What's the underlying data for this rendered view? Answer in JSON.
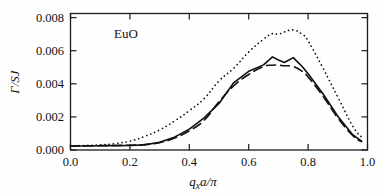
{
  "figure": {
    "annotation": "EuO",
    "background": "#fefefe"
  },
  "axes": {
    "x": {
      "title_q": "q",
      "title_sub": "x",
      "title_rest": "a/π",
      "ticks": [
        "0.0",
        "0.2",
        "0.4",
        "0.6",
        "0.8",
        "1.0"
      ],
      "min": 0.0,
      "max": 1.0
    },
    "y": {
      "title_gamma": "Γ/SJ",
      "ticks": [
        "0.000",
        "0.002",
        "0.004",
        "0.006",
        "0.008"
      ],
      "min": 0.0,
      "max": 0.0085
    }
  },
  "colors": {
    "curve": "#101010",
    "frame": "#1a1a1a",
    "text": "#111111"
  },
  "chart_data": {
    "type": "line",
    "title": "",
    "subtitle": "",
    "annotation": "EuO",
    "xlabel": "q_x a/π",
    "ylabel": "Γ/SJ",
    "xlim": [
      0.0,
      1.0
    ],
    "ylim": [
      0.0,
      0.0085
    ],
    "grid": false,
    "legend": "none",
    "xticks": [
      0.0,
      0.2,
      0.4,
      0.6,
      0.8,
      1.0
    ],
    "yticks": [
      0.0,
      0.002,
      0.004,
      0.006,
      0.008
    ],
    "x": [
      0.0,
      0.05,
      0.1,
      0.15,
      0.2,
      0.25,
      0.3,
      0.35,
      0.4,
      0.45,
      0.5,
      0.55,
      0.6,
      0.65,
      0.68,
      0.7,
      0.72,
      0.75,
      0.78,
      0.8,
      0.85,
      0.9,
      0.95,
      0.98
    ],
    "series": [
      {
        "name": "solid",
        "style": "solid",
        "values": [
          0.00025,
          0.00025,
          0.00026,
          0.00027,
          0.00028,
          0.00032,
          0.00048,
          0.0008,
          0.0013,
          0.002,
          0.0029,
          0.0042,
          0.0049,
          0.0053,
          0.0058,
          0.0056,
          0.00545,
          0.00575,
          0.0052,
          0.00475,
          0.0035,
          0.0021,
          0.00095,
          0.00055
        ]
      },
      {
        "name": "dashed",
        "style": "dashed",
        "values": [
          0.00025,
          0.00026,
          0.00027,
          0.00028,
          0.0003,
          0.00034,
          0.00046,
          0.00074,
          0.0012,
          0.00185,
          0.003,
          0.004,
          0.0047,
          0.0052,
          0.00528,
          0.00528,
          0.00525,
          0.0052,
          0.0049,
          0.00455,
          0.00335,
          0.002,
          0.0009,
          0.00052
        ]
      },
      {
        "name": "dotted",
        "style": "dotted",
        "values": [
          0.00026,
          0.00028,
          0.00032,
          0.0004,
          0.00055,
          0.00085,
          0.00125,
          0.0018,
          0.00245,
          0.0032,
          0.0043,
          0.0051,
          0.0061,
          0.0069,
          0.00725,
          0.0072,
          0.00735,
          0.00748,
          0.0072,
          0.0068,
          0.0051,
          0.0033,
          0.0015,
          0.0008
        ]
      }
    ]
  }
}
